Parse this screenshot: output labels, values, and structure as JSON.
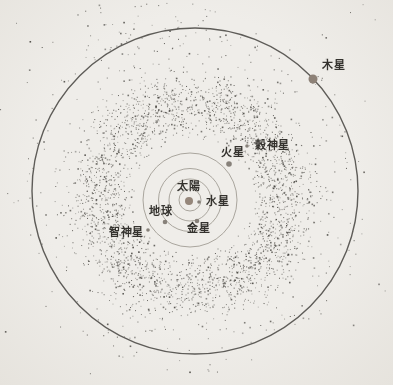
{
  "figure": {
    "name": "asteroid-belt-solar-system-diagram",
    "width": 393,
    "height": 385,
    "background": "#edebe6"
  },
  "colors": {
    "outer_orbit_stroke": "#5e5c58",
    "inner_orbit_stroke": "#a9a59d",
    "asteroid_dot": "#45433e",
    "label_text": "#34322e",
    "sun_fill": "#95867a",
    "large_planet_fill": "#8d8177",
    "small_planet_fill": "#87817a"
  },
  "outer_orbit": {
    "cx": 195,
    "cy": 191,
    "r": 163,
    "stroke_width": 1.4
  },
  "inner_orbits": {
    "cx": 190,
    "cy": 200,
    "radii": [
      11,
      21,
      31.5,
      47
    ],
    "stroke_width": 1
  },
  "labels": {
    "sun": {
      "text": "太陽",
      "x": 177,
      "y": 181
    },
    "mercury": {
      "text": "水星",
      "x": 206,
      "y": 196
    },
    "venus": {
      "text": "金星",
      "x": 187,
      "y": 223
    },
    "earth": {
      "text": "地球",
      "x": 149,
      "y": 206
    },
    "mars": {
      "text": "火星",
      "x": 221,
      "y": 147
    },
    "ceres": {
      "text": "穀神星",
      "x": 255,
      "y": 140
    },
    "pallas": {
      "text": "智神星",
      "x": 109,
      "y": 227
    },
    "jupiter": {
      "text": "木星",
      "x": 322,
      "y": 60
    }
  },
  "bodies": [
    {
      "id": "sun-dot",
      "x": 189,
      "y": 201,
      "r": 4.0,
      "fill": "sun_fill"
    },
    {
      "id": "mercury-dot",
      "x": 199,
      "y": 202,
      "r": 1.8,
      "fill": "small_planet_fill"
    },
    {
      "id": "venus-dot",
      "x": 197,
      "y": 221,
      "r": 2.3,
      "fill": "small_planet_fill"
    },
    {
      "id": "earth-dot",
      "x": 165,
      "y": 222,
      "r": 2.3,
      "fill": "small_planet_fill"
    },
    {
      "id": "mars-dot",
      "x": 229,
      "y": 164,
      "r": 2.8,
      "fill": "small_planet_fill"
    },
    {
      "id": "ceres-dot",
      "x": 247,
      "y": 146,
      "r": 1.8,
      "fill": "small_planet_fill"
    },
    {
      "id": "pallas-dot",
      "x": 148,
      "y": 230,
      "r": 1.8,
      "fill": "small_planet_fill"
    },
    {
      "id": "jupiter-dot",
      "x": 313,
      "y": 79,
      "r": 4.5,
      "fill": "large_planet_fill"
    }
  ],
  "belt": {
    "cx": 192,
    "cy": 196,
    "seed": 1337,
    "ring_count": 2800,
    "ring_mean_r": 95,
    "ring_sd": 16,
    "ring_min_r": 58,
    "inner_sparse_count": 90,
    "outer_halo_count": 270,
    "outer_halo_min_r": 124,
    "outer_halo_max_r": 176,
    "top_cluster_count": 55,
    "margin_stray_count": 70,
    "margin_stray_min_dist": 148
  }
}
